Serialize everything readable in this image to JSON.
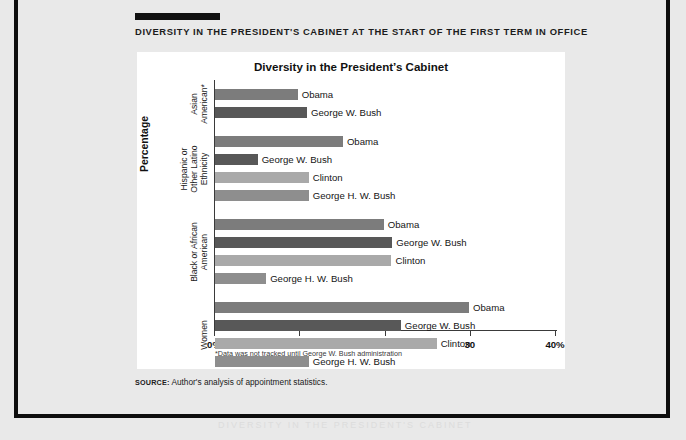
{
  "page": {
    "kicker": "DIVERSITY IN THE PRESIDENT'S CABINET AT THE START OF THE FIRST TERM IN OFFICE",
    "source_label": "SOURCE:",
    "source_text": " Author's analysis of appointment statistics.",
    "ghost_text": "DIVERSITY IN THE PRESIDENT'S CABINET"
  },
  "chart_data": {
    "type": "bar",
    "orientation": "horizontal",
    "title": "Diversity in the President’s Cabinet",
    "xlabel": "",
    "ylabel": "Percentage",
    "xlim": [
      0,
      40
    ],
    "grid": false,
    "legend": "none",
    "footnote": "*Data was not tracked until George W. Bush administration",
    "xticks": [
      0,
      10,
      20,
      30,
      40
    ],
    "xtick_labels": [
      "0%",
      "10",
      "20",
      "30",
      "40%"
    ],
    "series_colors": {
      "Obama": "#7c7c7c",
      "George W. Bush": "#585858",
      "Clinton": "#a9a9a9",
      "George H. W. Bush": "#8e8e8e"
    },
    "groups": [
      {
        "label": "Asian\nAmerican*",
        "bars": [
          {
            "name": "Obama",
            "value": 9.7
          },
          {
            "name": "George W. Bush",
            "value": 10.8
          }
        ]
      },
      {
        "label": "Hispanic or\nOther Latino\nEthnicity",
        "bars": [
          {
            "name": "Obama",
            "value": 15.0
          },
          {
            "name": "George W. Bush",
            "value": 5.0
          },
          {
            "name": "Clinton",
            "value": 11.0
          },
          {
            "name": "George H. W. Bush",
            "value": 11.0
          }
        ]
      },
      {
        "label": "Black or African\nAmerican",
        "bars": [
          {
            "name": "Obama",
            "value": 19.8
          },
          {
            "name": "George W. Bush",
            "value": 20.8
          },
          {
            "name": "Clinton",
            "value": 20.7
          },
          {
            "name": "George H. W. Bush",
            "value": 6.0
          }
        ]
      },
      {
        "label": "Women",
        "bars": [
          {
            "name": "Obama",
            "value": 29.8
          },
          {
            "name": "George W. Bush",
            "value": 21.8
          },
          {
            "name": "Clinton",
            "value": 26.0
          },
          {
            "name": "George H. W. Bush",
            "value": 11.0
          }
        ]
      }
    ]
  }
}
